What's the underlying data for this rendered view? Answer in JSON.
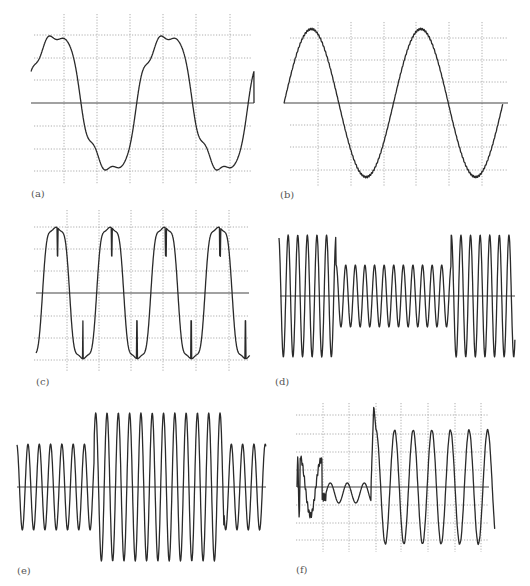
{
  "figure": {
    "panels": [
      {
        "id": "a",
        "label": "(a)",
        "label_pos": [
          31,
          197
        ],
        "description": "Distorted sine waveform with harmonic notches near peaks (two cycles)",
        "grid": {
          "x": [
            64,
            97,
            130,
            163,
            196,
            230
          ],
          "y": [
            35,
            58,
            80,
            126,
            149,
            171
          ],
          "x_range": [
            34,
            252
          ],
          "y_range": [
            14,
            184
          ]
        },
        "axis": {
          "y": 103,
          "x0": 31,
          "x1": 254
        },
        "wave": {
          "kind": "distorted-sine",
          "x0": 31,
          "x1": 254,
          "y0": 103,
          "amp": 78,
          "cycles": 2.0,
          "phase": 0.04,
          "h3": 0.12,
          "h5": 0.07,
          "h7": 0.03
        }
      },
      {
        "id": "b",
        "label": "(b)",
        "label_pos": [
          280,
          198
        ],
        "description": "Clean sine waveform with slight high-frequency ripple (two cycles)",
        "grid": {
          "x": [
            318,
            351,
            384,
            416,
            449,
            482
          ],
          "y": [
            38,
            60,
            82,
            125,
            147,
            170
          ],
          "x_range": [
            290,
            508
          ],
          "y_range": [
            22,
            186
          ]
        },
        "axis": {
          "y": 103,
          "x0": 284,
          "x1": 508
        },
        "wave": {
          "kind": "sine-ripple",
          "x0": 284,
          "x1": 503,
          "y0": 103,
          "amp": 74,
          "cycles": 2.0,
          "phase": 0,
          "ripple": 0.9
        }
      },
      {
        "id": "c",
        "label": "(c)",
        "label_pos": [
          36,
          385
        ],
        "description": "Non-sinusoidal waveform with flat peaks, commutation notches and spikes (four cycles)",
        "grid": {
          "x": [
            67,
            99,
            131,
            163,
            196,
            229
          ],
          "y": [
            227,
            249,
            271,
            316,
            338,
            360
          ],
          "x_range": [
            34,
            248
          ],
          "y_range": [
            210,
            372
          ]
        },
        "axis": {
          "y": 293,
          "x0": 36,
          "x1": 249
        },
        "wave": {
          "kind": "notched",
          "x0": 36,
          "x1": 250,
          "y0": 293,
          "amp": 72,
          "cycles": 3.95,
          "phase": -0.12
        }
      },
      {
        "id": "d",
        "label": "(d)",
        "label_pos": [
          275,
          385
        ],
        "description": "Voltage sag: sine amplitude drops to about half then recovers",
        "grid": null,
        "axis": {
          "y": 296,
          "x0": 280,
          "x1": 515
        },
        "wave": {
          "kind": "amp-step",
          "x0": 279,
          "x1": 515,
          "y0": 296,
          "period": 9.6,
          "phase": 0.3,
          "segments": [
            {
              "x_end": 336,
              "amp": 61
            },
            {
              "x_end": 451,
              "amp": 31
            },
            {
              "x_end": 515,
              "amp": 61
            }
          ]
        }
      },
      {
        "id": "e",
        "label": "(e)",
        "label_pos": [
          17,
          574
        ],
        "description": "Voltage swell: sine amplitude rises then returns to normal",
        "grid": null,
        "axis": {
          "y": 487,
          "x0": 17,
          "x1": 266
        },
        "wave": {
          "kind": "amp-step",
          "x0": 17,
          "x1": 266,
          "y0": 487,
          "period": 11.3,
          "phase": 0.28,
          "segments": [
            {
              "x_end": 94,
              "amp": 43
            },
            {
              "x_end": 224,
              "amp": 74
            },
            {
              "x_end": 266,
              "amp": 43
            }
          ]
        }
      },
      {
        "id": "f",
        "label": "(f)",
        "label_pos": [
          296,
          573
        ],
        "description": "Interruption with transient followed by recovery to large oscillation",
        "grid": {
          "x": [
            323,
            349,
            376,
            401,
            428,
            455,
            481
          ],
          "y": [
            415,
            434,
            452,
            470,
            505,
            523,
            540
          ],
          "x_range": [
            296,
            489
          ],
          "y_range": [
            403,
            552
          ]
        },
        "axis": {
          "y": 487,
          "x0": 297,
          "x1": 489
        },
        "wave": {
          "kind": "interrupt",
          "x0": 297,
          "x1": 495,
          "y0": 487
        }
      }
    ]
  }
}
